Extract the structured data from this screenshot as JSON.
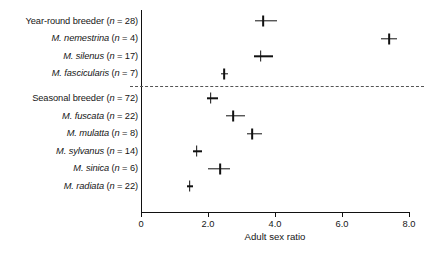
{
  "chart_data": {
    "type": "scatter",
    "orientation": "horizontal",
    "title": "",
    "xlabel": "Adult sex ratio",
    "ylabel": "",
    "xlim": [
      0,
      8.0
    ],
    "xticks": [
      0,
      2.0,
      4.0,
      6.0,
      8.0
    ],
    "xticklabels": [
      "0",
      "2.0",
      "4.0",
      "6.0",
      "8.0"
    ],
    "grid": false,
    "legend": null,
    "marker": "plus-with-horizontal-error-bar",
    "group_divider": {
      "style": "dashed",
      "between": [
        "M. fascicularis (n = 7)",
        "Seasonal breeder (n = 72)"
      ]
    },
    "categories": [
      "Year-round breeder (n = 28)",
      "M. nemestrina (n = 4)",
      "M. silenus (n = 17)",
      "M. fascicularis (n = 7)",
      "Seasonal breeder (n = 72)",
      "M. fuscata (n = 22)",
      "M. mulatta (n = 8)",
      "M. sylvanus (n = 14)",
      "M. sinica (n = 6)",
      "M. radiata (n = 22)"
    ],
    "values": [
      3.65,
      7.4,
      3.57,
      2.48,
      2.08,
      2.75,
      3.32,
      1.66,
      2.36,
      1.45
    ],
    "err_low": [
      3.4,
      7.15,
      3.37,
      2.4,
      1.97,
      2.55,
      3.15,
      1.55,
      2.0,
      1.37
    ],
    "err_high": [
      4.05,
      7.65,
      3.95,
      2.6,
      2.3,
      3.1,
      3.6,
      1.82,
      2.66,
      1.56
    ],
    "rows": [
      {
        "group": "year-round",
        "label_prefix": "",
        "label_species": "Year-round breeder",
        "label_n": "(n = 28)",
        "italic_species": false,
        "value": 3.65,
        "err_low": 3.4,
        "err_high": 4.05
      },
      {
        "group": "year-round",
        "label_prefix": "",
        "label_species": "M. nemestrina",
        "label_n": "(n = 4)",
        "italic_species": true,
        "value": 7.4,
        "err_low": 7.15,
        "err_high": 7.65
      },
      {
        "group": "year-round",
        "label_prefix": "",
        "label_species": "M. silenus",
        "label_n": "(n = 17)",
        "italic_species": true,
        "value": 3.57,
        "err_low": 3.37,
        "err_high": 3.95
      },
      {
        "group": "year-round",
        "label_prefix": "",
        "label_species": "M. fascicularis",
        "label_n": "(n = 7)",
        "italic_species": true,
        "value": 2.48,
        "err_low": 2.4,
        "err_high": 2.6
      },
      {
        "group": "seasonal",
        "label_prefix": "",
        "label_species": "Seasonal breeder",
        "label_n": "(n = 72)",
        "italic_species": false,
        "value": 2.08,
        "err_low": 1.97,
        "err_high": 2.3
      },
      {
        "group": "seasonal",
        "label_prefix": "",
        "label_species": "M. fuscata",
        "label_n": "(n = 22)",
        "italic_species": true,
        "value": 2.75,
        "err_low": 2.55,
        "err_high": 3.1
      },
      {
        "group": "seasonal",
        "label_prefix": "",
        "label_species": "M. mulatta",
        "label_n": "(n = 8)",
        "italic_species": true,
        "value": 3.32,
        "err_low": 3.15,
        "err_high": 3.6
      },
      {
        "group": "seasonal",
        "label_prefix": "",
        "label_species": "M. sylvanus",
        "label_n": "(n = 14)",
        "italic_species": true,
        "value": 1.66,
        "err_low": 1.55,
        "err_high": 1.82
      },
      {
        "group": "seasonal",
        "label_prefix": "",
        "label_species": "M. sinica",
        "label_n": "(n = 6)",
        "italic_species": true,
        "value": 2.36,
        "err_low": 2.0,
        "err_high": 2.66
      },
      {
        "group": "seasonal",
        "label_prefix": "",
        "label_species": "M. radiata",
        "label_n": "(n = 22)",
        "italic_species": true,
        "value": 1.45,
        "err_low": 1.37,
        "err_high": 1.56
      }
    ],
    "colors": {
      "marker": "#111111",
      "axis": "#111111",
      "text": "#161616",
      "divider": "#555555",
      "background": "#ffffff"
    }
  },
  "axis": {
    "x_title": "Adult sex ratio"
  }
}
